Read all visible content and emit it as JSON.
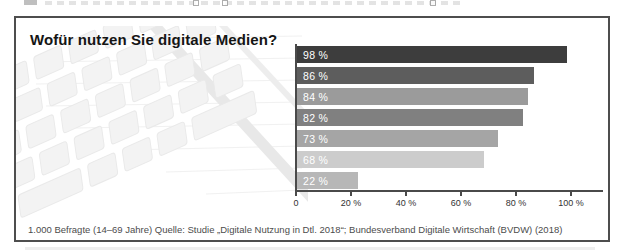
{
  "chart_data": {
    "type": "bar",
    "orientation": "horizontal",
    "title": "Wofür nutzen Sie digitale Medien?",
    "values": [
      98,
      86,
      84,
      82,
      73,
      68,
      22
    ],
    "bar_labels": [
      "98 %",
      "86 %",
      "84 %",
      "82 %",
      "73 %",
      "68 %",
      "22 %"
    ],
    "bar_colors": [
      "#3d3d3d",
      "#5d5d5d",
      "#9b9b9b",
      "#808080",
      "#a5a5a5",
      "#cccccc",
      "#b7b7b7"
    ],
    "bar_label_color": "#ffffff",
    "axis_color": "#4a4a4a",
    "xlim": [
      0,
      111
    ],
    "x_ticks": [
      0,
      20,
      40,
      60,
      80,
      100
    ],
    "x_tick_labels": [
      "0",
      "20 %",
      "40 %",
      "60 %",
      "80 %",
      "100 %"
    ],
    "grid": false,
    "legend": false,
    "footnote": "1.000 Befragte (14–69 Jahre) Quelle: Studie „Digitale Nutzung in Dtl. 2018“; Bundesverband Digitale Wirtschaft (BVDW) (2018)"
  },
  "decoration": {
    "background_image": "faded keyboard, pencil and lined notepad photo"
  }
}
